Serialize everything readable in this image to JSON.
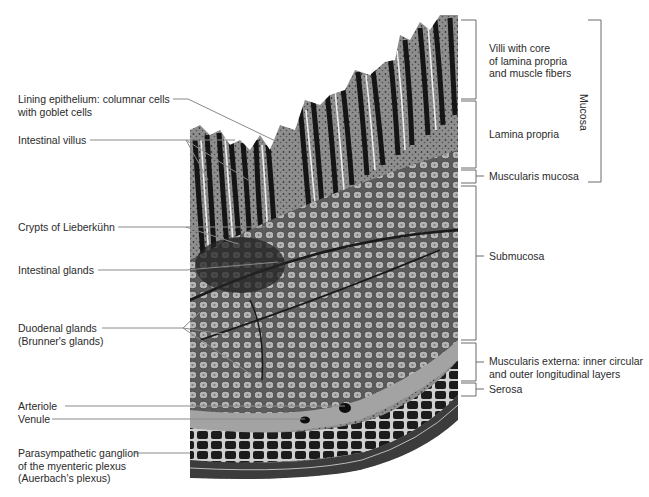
{
  "figure": {
    "left_labels": [
      {
        "id": "lining-epithelium",
        "lines": [
          "Lining epithelium: columnar cells",
          "with goblet cells"
        ]
      },
      {
        "id": "intestinal-villus",
        "lines": [
          "Intestinal villus"
        ]
      },
      {
        "id": "crypts-of-lieberkuhn",
        "lines": [
          "Crypts of Lieberkühn"
        ]
      },
      {
        "id": "intestinal-glands",
        "lines": [
          "Intestinal glands"
        ]
      },
      {
        "id": "duodenal-glands",
        "lines": [
          "Duodenal glands",
          "(Brunner's glands)"
        ]
      },
      {
        "id": "arteriole",
        "lines": [
          "Arteriole"
        ]
      },
      {
        "id": "venule",
        "lines": [
          "Venule"
        ]
      },
      {
        "id": "parasympathetic-ganglion",
        "lines": [
          "Parasympathetic ganglion",
          "of the myenteric plexus",
          "(Auerbach's plexus)"
        ]
      }
    ],
    "right_labels": [
      {
        "id": "villi-core",
        "lines": [
          "Villi with core",
          "of lamina propria",
          "and muscle fibers"
        ]
      },
      {
        "id": "lamina-propria",
        "lines": [
          "Lamina propria"
        ]
      },
      {
        "id": "muscularis-mucosa",
        "lines": [
          "Muscularis mucosa"
        ]
      },
      {
        "id": "submucosa",
        "lines": [
          "Submucosa"
        ]
      },
      {
        "id": "muscularis-externa",
        "lines": [
          "Muscularis externa: inner circular",
          "and outer longitudinal layers"
        ]
      },
      {
        "id": "serosa",
        "lines": [
          "Serosa"
        ]
      }
    ],
    "group_label": "Mucosa",
    "colors": {
      "leader": "#8a8a8a",
      "bracket": "#6a6a6a",
      "text": "#2a2a2a",
      "tissue_dark": "#1e1e1e",
      "tissue_mid": "#6f6f6f",
      "tissue_light": "#b9b9b9"
    }
  }
}
